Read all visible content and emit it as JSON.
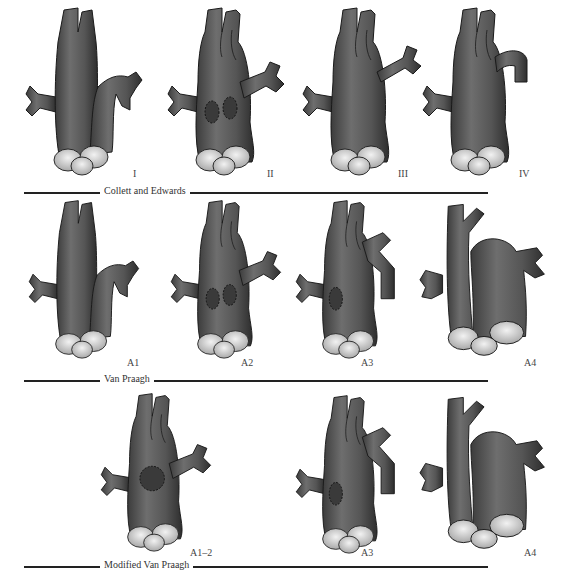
{
  "rows": [
    {
      "title": "Collett and Edwards",
      "types": [
        {
          "label": "I",
          "variant": "type1"
        },
        {
          "label": "II",
          "variant": "type2"
        },
        {
          "label": "III",
          "variant": "type3"
        },
        {
          "label": "IV",
          "variant": "type4"
        }
      ]
    },
    {
      "title": "Van Praagh",
      "types": [
        {
          "label": "A1",
          "variant": "type1"
        },
        {
          "label": "A2",
          "variant": "type2"
        },
        {
          "label": "A3",
          "variant": "typeA3"
        },
        {
          "label": "A4",
          "variant": "typeA4"
        }
      ]
    },
    {
      "title": "Modified Van Praagh",
      "types": [
        {
          "label": "A1–2",
          "variant": "typeA12"
        },
        {
          "label": "A3",
          "variant": "typeA3"
        },
        {
          "label": "A4",
          "variant": "typeA4"
        }
      ]
    }
  ],
  "colors": {
    "vessel": "#5a5a5a",
    "vessel_dark": "#3a3a3a",
    "valve": "#d8d8d8",
    "outline": "#1a1a1a"
  }
}
